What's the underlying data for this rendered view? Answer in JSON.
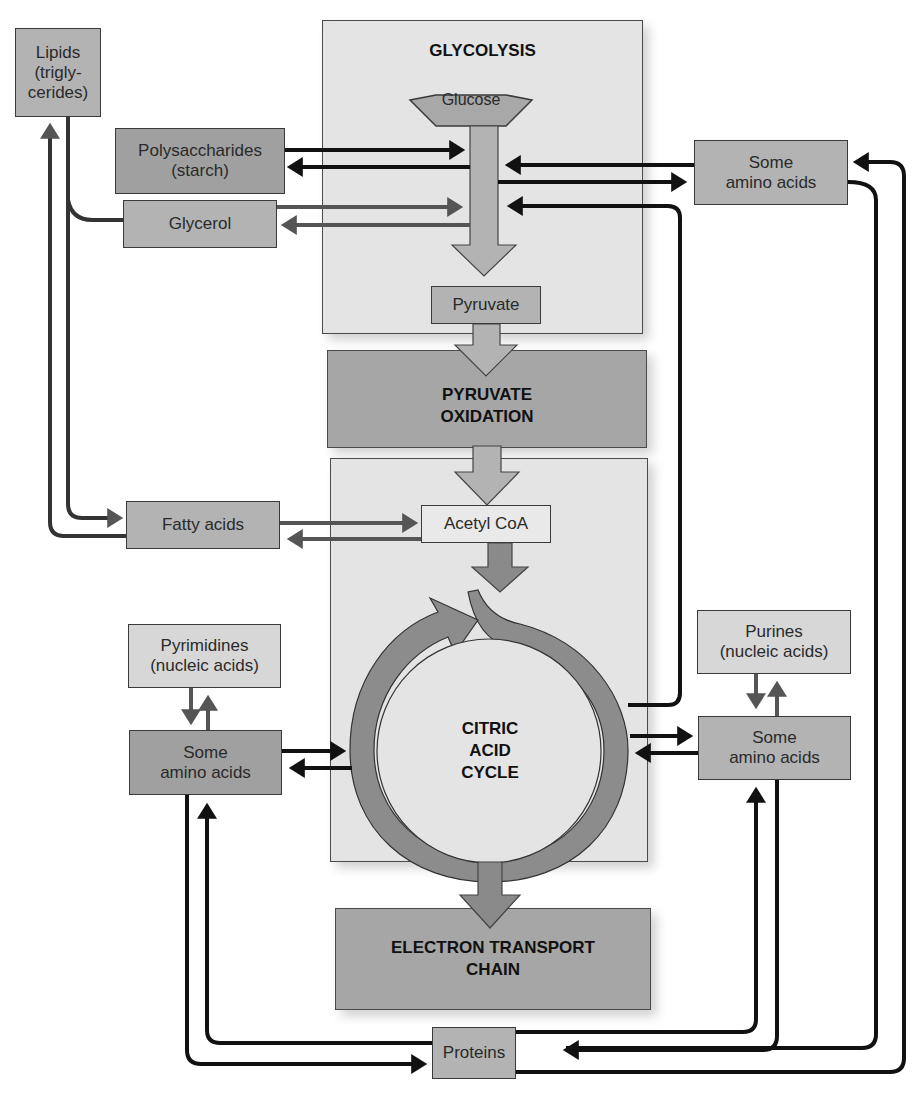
{
  "diagram": {
    "type": "metabolic-pathway",
    "stages": {
      "glycolysis": "GLYCOLYSIS",
      "pyruvate_oxidation_line1": "PYRUVATE",
      "pyruvate_oxidation_line2": "OXIDATION",
      "citric_acid_line1": "CITRIC",
      "citric_acid_line2": "ACID",
      "citric_acid_line3": "CYCLE",
      "etc_line1": "ELECTRON TRANSPORT",
      "etc_line2": "CHAIN"
    },
    "nodes": {
      "glucose": "Glucose",
      "pyruvate": "Pyruvate",
      "acetyl_coa": "Acetyl CoA",
      "lipids_line1": "Lipids",
      "lipids_line2": "(trigly-",
      "lipids_line3": "cerides)",
      "polysaccharides_line1": "Polysaccharides",
      "polysaccharides_line2": "(starch)",
      "glycerol": "Glycerol",
      "fatty_acids": "Fatty acids",
      "amino_top_line1": "Some",
      "amino_top_line2": "amino acids",
      "pyrimidines_line1": "Pyrimidines",
      "pyrimidines_line2": "(nucleic acids)",
      "amino_left_line1": "Some",
      "amino_left_line2": "amino acids",
      "purines_line1": "Purines",
      "purines_line2": "(nucleic acids)",
      "amino_right_line1": "Some",
      "amino_right_line2": "amino acids",
      "proteins": "Proteins"
    },
    "colors": {
      "panel_light": "#e4e4e4",
      "panel_dark": "#a6a6a6",
      "main_arrow": "#b0b0b0",
      "cycle_arrow": "#8a8a8a",
      "connector_black": "#111111",
      "connector_gray": "#555555"
    }
  }
}
